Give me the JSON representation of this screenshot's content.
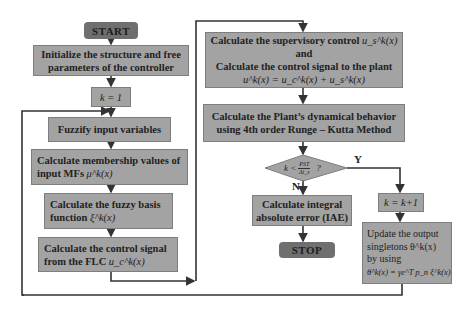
{
  "flowchart": {
    "start": "START",
    "stop": "STOP",
    "init": {
      "line1": "Initialize the structure and free",
      "line2": "parameters of the controller"
    },
    "k_init": "k = 1",
    "fuzzify": "Fuzzify input variables",
    "membership": {
      "line1": "Calculate membership values of",
      "line2": "input MFs",
      "math": "μ^k(x)"
    },
    "fuzzy_basis": {
      "line1": "Calculate the fuzzy basis",
      "line2": "function",
      "math": "ξ^k(x)"
    },
    "flc_signal": {
      "line1": "Calculate the control signal",
      "line2": "from the FLC",
      "math": "u_c^k(x)"
    },
    "supervisory": {
      "line1": "Calculate the supervisory control",
      "line1_math": "u_s^k(x)",
      "line2": "and",
      "line3": "Calculate the control signal to the plant",
      "line4": "u^k(x) = u_c^k(x) + u_s^k(x)"
    },
    "plant": {
      "line1": "Calculate the Plant’s dynamical behavior",
      "line2": "using 4th order Runge – Kutta Method"
    },
    "decision": {
      "lhs": "k <",
      "num": "PST",
      "den": "Δt_s",
      "q": "?"
    },
    "branch_yes": "Y",
    "branch_no": "N",
    "iae": {
      "line1": "Calculate integral",
      "line2": "absolute error (IAE)"
    },
    "k_increment": "k = k+1",
    "update": {
      "line1": "Update the output",
      "line2": "singletons θ^k(x)",
      "line3": "by using",
      "line4": "θ̇^k(x) = γe^T p_n ξ^k(x)"
    }
  },
  "colors": {
    "box_fill": "#a3a3a3",
    "terminal_fill": "#6f6f6f",
    "line": "#333333",
    "background": "#ffffff"
  }
}
